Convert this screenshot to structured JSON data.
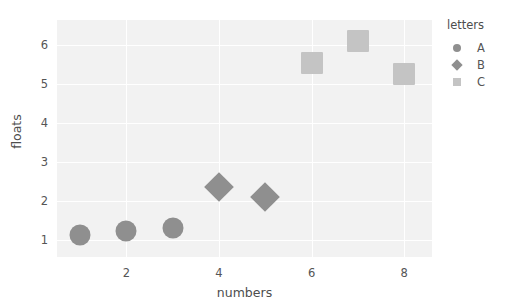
{
  "chart_data": {
    "type": "scatter",
    "title": "",
    "xlabel": "numbers",
    "ylabel": "floats",
    "xlim": [
      0.5,
      8.6
    ],
    "ylim": [
      0.55,
      6.65
    ],
    "xticks": [
      2,
      4,
      6,
      8
    ],
    "yticks": [
      1,
      2,
      3,
      4,
      5,
      6
    ],
    "xtick_labels": [
      "2",
      "4",
      "6",
      "8"
    ],
    "ytick_labels": [
      "1",
      "2",
      "3",
      "4",
      "5",
      "6"
    ],
    "grid": true,
    "grid_color": "#ffffff",
    "panel_background": "#f2f2f2",
    "legend": {
      "title": "letters",
      "position": "right",
      "entries": [
        {
          "label": "A",
          "marker": "circle",
          "color": "#8f8f8f"
        },
        {
          "label": "B",
          "marker": "diamond",
          "color": "#8f8f8f"
        },
        {
          "label": "C",
          "marker": "square",
          "color": "#c4c4c4"
        }
      ]
    },
    "series": [
      {
        "name": "A",
        "marker": "circle",
        "color": "#8f8f8f",
        "size": 21,
        "points": [
          {
            "x": 1,
            "y": 1.12
          },
          {
            "x": 2,
            "y": 1.22
          },
          {
            "x": 3,
            "y": 1.3
          }
        ]
      },
      {
        "name": "B",
        "marker": "diamond",
        "color": "#8f8f8f",
        "size": 21,
        "points": [
          {
            "x": 4,
            "y": 2.35
          },
          {
            "x": 5,
            "y": 2.1
          }
        ]
      },
      {
        "name": "C",
        "marker": "square",
        "color": "#c4c4c4",
        "size": 22,
        "points": [
          {
            "x": 6,
            "y": 5.55
          },
          {
            "x": 7,
            "y": 6.12
          },
          {
            "x": 8,
            "y": 5.25
          }
        ]
      }
    ]
  }
}
